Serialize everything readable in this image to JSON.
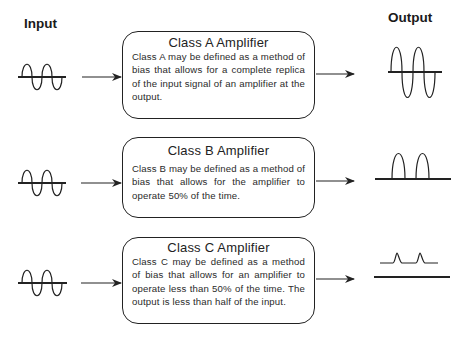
{
  "headings": {
    "input": "Input",
    "output": "Output"
  },
  "classes": [
    {
      "title": "Class A Amplifier",
      "description": "Class A may be defined as a method of bias that allows for a complete replica of the input signal of an amplifier at the output.",
      "output_waveform": "full-sine-wave"
    },
    {
      "title": "Class B Amplifier",
      "description": "Class B may be defined as a method of bias that allows for  the amplifier to operate 50% of the time.",
      "output_waveform": "half-wave-positive-lobes"
    },
    {
      "title": "Class C Amplifier",
      "description": "Class C may be defined as a method of bias that allows for an amplifier to operate less than 50% of the time.  The output is less than half of the input.",
      "output_waveform": "small-pulses-above-baseline"
    }
  ],
  "colors": {
    "stroke": "#222222",
    "background": "#ffffff"
  }
}
